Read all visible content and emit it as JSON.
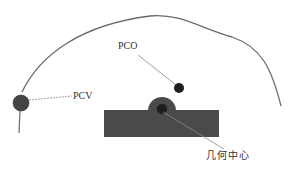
{
  "diagram": {
    "labels": {
      "pcv": "PCV",
      "pco": "PCO",
      "geometric_center": "几何中心"
    },
    "colors": {
      "outline": "#6a6a6a",
      "body_fill": "#4a4a4a",
      "dot_fill": "#1e1e1e",
      "pcv_dot_fill": "#444444",
      "leader": "#888888",
      "text": "#333333"
    }
  }
}
